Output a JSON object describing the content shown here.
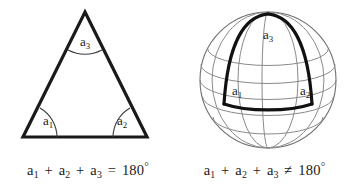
{
  "figure": {
    "background_color": "#ffffff",
    "ink_color": "#1a1a1a",
    "grid_color": "#8a8a8a",
    "width": 353,
    "height": 190
  },
  "panels": [
    {
      "id": "euclidean",
      "shape": "plane-triangle",
      "caption": {
        "a1": "a",
        "a1_sub": "1",
        "plus1": "+",
        "a2": "a",
        "a2_sub": "2",
        "plus2": "+",
        "a3": "a",
        "a3_sub": "3",
        "relation": "=",
        "value": "180",
        "degree": "°"
      },
      "angle_labels": [
        {
          "name": "a1",
          "base": "a",
          "sub": "1",
          "x": 48,
          "y": 122
        },
        {
          "name": "a2",
          "base": "a",
          "sub": "2",
          "x": 122,
          "y": 122
        },
        {
          "name": "a3",
          "base": "a",
          "sub": "3",
          "x": 85,
          "y": 43
        }
      ],
      "vertices": {
        "apex": {
          "x": 85,
          "y": 12
        },
        "bottom_left": {
          "x": 23,
          "y": 137
        },
        "bottom_right": {
          "x": 147,
          "y": 137
        }
      },
      "angle_sum_degrees": 180
    },
    {
      "id": "spherical",
      "shape": "sphere-triangle",
      "caption": {
        "a1": "a",
        "a1_sub": "1",
        "plus1": "+",
        "a2": "a",
        "a2_sub": "2",
        "plus2": "+",
        "a3": "a",
        "a3_sub": "3",
        "relation": "≠",
        "value": "180",
        "degree": "°"
      },
      "angle_labels": [
        {
          "name": "a1",
          "base": "a",
          "sub": "1",
          "x": 61,
          "y": 92
        },
        {
          "name": "a2",
          "base": "a",
          "sub": "2",
          "x": 129,
          "y": 92
        },
        {
          "name": "a3",
          "base": "a",
          "sub": "3",
          "x": 92,
          "y": 36
        }
      ],
      "sphere": {
        "center_x": 92,
        "center_y": 80,
        "radius": 68,
        "latitude_lines": 5,
        "longitude_lines": 5
      },
      "angle_sum_degrees": "greater than 180"
    }
  ]
}
